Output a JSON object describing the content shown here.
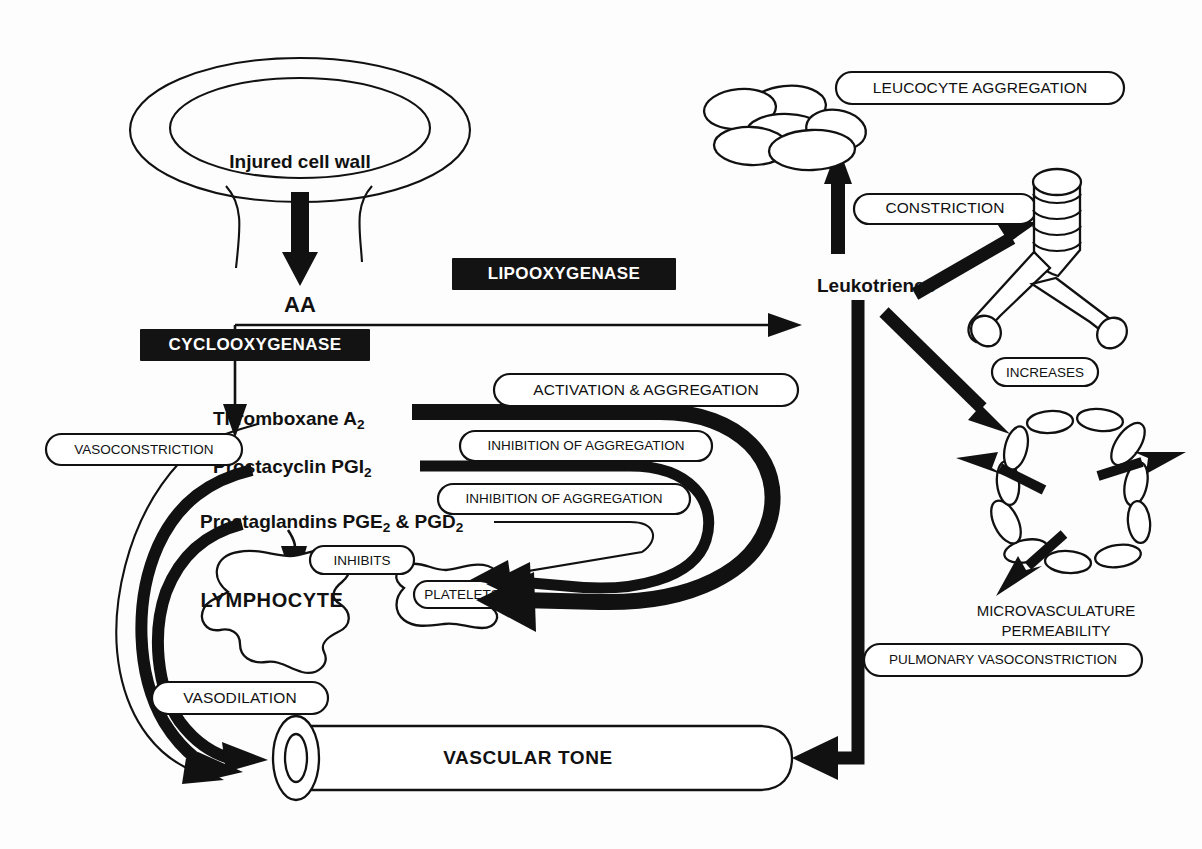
{
  "diagram": {
    "background_color": "#fdfdfd",
    "ink_color": "#111111",
    "nodes": {
      "injured_cell_wall": "Injured cell wall",
      "aa": "AA",
      "thromboxane": "Thromboxane A",
      "thromboxane_sub": "2",
      "prostacyclin": "Prostacyclin PGI",
      "prostacyclin_sub": "2",
      "prostaglandins_a": "Prostaglandins PGE",
      "prostaglandins_sub_a": "2",
      "prostaglandins_b": " & PGD",
      "prostaglandins_sub_b": "2",
      "leukotrienes": "Leukotrienes",
      "lymphocyte": "LYMPHOCYTE",
      "platelets": "PLATELETS",
      "vascular_tone": "VASCULAR TONE",
      "microvasculature_line1": "MICROVASCULATURE",
      "microvasculature_line2": "PERMEABILITY"
    },
    "enzyme_boxes": [
      {
        "label": "LIPOOXYGENASE",
        "style": "black-inverse"
      },
      {
        "label": "CYCLOOXYGENASE",
        "style": "black-inverse"
      }
    ],
    "effect_pills": [
      {
        "label": "LEUCOCYTE AGGREGATION"
      },
      {
        "label": "CONSTRICTION"
      },
      {
        "label": "INCREASES"
      },
      {
        "label": "ACTIVATION & AGGREGATION"
      },
      {
        "label": "INHIBITION OF AGGREGATION"
      },
      {
        "label": "INHIBITION OF AGGREGATION"
      },
      {
        "label": "VASOCONSTRICTION"
      },
      {
        "label": "INHIBITS"
      },
      {
        "label": "VASODILATION"
      },
      {
        "label": "PULMONARY VASOCONSTRICTION"
      }
    ]
  }
}
